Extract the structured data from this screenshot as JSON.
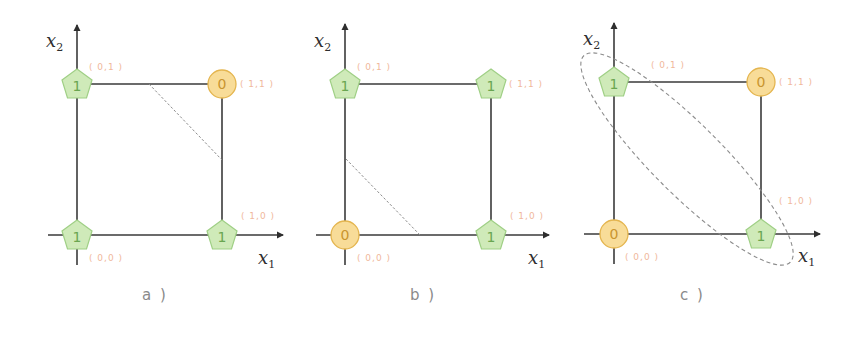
{
  "colors": {
    "axis": "#3a3a3a",
    "dashed": "#8c8c8c",
    "class1_fill": "#cfeab9",
    "class1_stroke": "#9fcf85",
    "class1_text": "#6aa651",
    "class0_fill": "#f8dc98",
    "class0_stroke": "#e4b54f",
    "class0_text": "#c9952f",
    "coord_label": "#f0b89c",
    "caption": "#8a8a8a"
  },
  "axis_labels": {
    "x1": "x",
    "x1_sub": "1",
    "x2": "x",
    "x2_sub": "2"
  },
  "panels": [
    {
      "caption": "a )",
      "operation": "OR-like (NAND pattern)",
      "points": [
        {
          "coord": "( 0,1 )",
          "value": "1",
          "shape": "pentagon"
        },
        {
          "coord": "( 1,1 )",
          "value": "0",
          "shape": "circle"
        },
        {
          "coord": "( 0,0 )",
          "value": "1",
          "shape": "pentagon"
        },
        {
          "coord": "( 1,0 )",
          "value": "1",
          "shape": "pentagon"
        }
      ],
      "separator": "dashed-line"
    },
    {
      "caption": "b )",
      "points": [
        {
          "coord": "( 0,1 )",
          "value": "1",
          "shape": "pentagon"
        },
        {
          "coord": "( 1,1 )",
          "value": "1",
          "shape": "pentagon"
        },
        {
          "coord": "( 0,0 )",
          "value": "0",
          "shape": "circle"
        },
        {
          "coord": "( 1,0 )",
          "value": "1",
          "shape": "pentagon"
        }
      ],
      "separator": "dashed-line"
    },
    {
      "caption": "c )",
      "points": [
        {
          "coord": "( 0,1 )",
          "value": "1",
          "shape": "pentagon"
        },
        {
          "coord": "( 1,1 )",
          "value": "0",
          "shape": "circle"
        },
        {
          "coord": "( 0,0 )",
          "value": "0",
          "shape": "circle"
        },
        {
          "coord": "( 1,0 )",
          "value": "1",
          "shape": "pentagon"
        }
      ],
      "separator": "dashed-ellipse"
    }
  ]
}
